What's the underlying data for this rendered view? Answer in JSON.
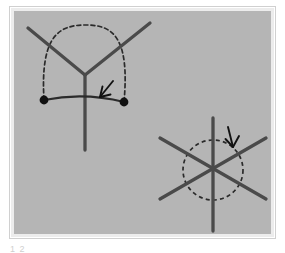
{
  "figure": {
    "canvas": {
      "width": 285,
      "height": 251,
      "background": "#ffffff"
    },
    "panel": {
      "name": "gray-panel",
      "x": 13,
      "y": 10,
      "width": 259,
      "height": 225,
      "fill": "#b5b5b5",
      "border_color": "#e8e8e8",
      "border_width": 4,
      "outer_edge_color": "#d0d0d0"
    },
    "stroke": {
      "line_color": "#4a4a4a",
      "line_width": 3.2,
      "dash_color": "#2a2a2a",
      "dash_width": 1.6,
      "dash_pattern": "4 3",
      "arrow_color": "#1a1a1a",
      "dot_color": "#111111",
      "dot_radius": 4.2
    },
    "left_diagram": {
      "name": "y-vertex-with-dashed-dome",
      "vertex": {
        "x": 85,
        "y": 75
      },
      "arms": [
        {
          "name": "upper-left-arm",
          "x1": 28,
          "y1": 28,
          "x2": 85,
          "y2": 75
        },
        {
          "name": "upper-right-arm",
          "x1": 150,
          "y1": 23,
          "x2": 85,
          "y2": 75
        },
        {
          "name": "lower-stem",
          "x1": 85,
          "y1": 75,
          "x2": 85,
          "y2": 150
        }
      ],
      "dashed_arc": {
        "name": "dashed-dome-arc",
        "path": "M 44,100 C 40,34 60,25 86,25 C 112,25 130,36 124,102"
      },
      "solid_curve": {
        "name": "solid-chord-curve",
        "path": "M 44,100 Q 84,92 124,102"
      },
      "endpoints": [
        {
          "name": "left-endpoint-dot",
          "x": 44,
          "y": 100
        },
        {
          "name": "right-endpoint-dot",
          "x": 124,
          "y": 102
        }
      ],
      "arrow": {
        "name": "left-arrow",
        "shaft": {
          "x1": 113,
          "y1": 82,
          "x2": 100,
          "y2": 97
        },
        "head": "M 100,97 L 107,88 M 100,97 L 110,96"
      }
    },
    "right_diagram": {
      "name": "six-ray-star-with-dashed-circle",
      "center": {
        "x": 213,
        "y": 170
      },
      "lines": [
        {
          "name": "vertical-line",
          "x1": 213,
          "y1": 118,
          "x2": 213,
          "y2": 231
        },
        {
          "name": "diagonal-line-up-right",
          "x1": 160,
          "y1": 199,
          "x2": 266,
          "y2": 138
        },
        {
          "name": "diagonal-line-down-right",
          "x1": 160,
          "y1": 138,
          "x2": 266,
          "y2": 199
        }
      ],
      "dashed_circle": {
        "name": "dashed-circle",
        "cx": 213,
        "cy": 170,
        "r": 30
      },
      "arrow": {
        "name": "right-arrow",
        "shaft": {
          "x1": 229,
          "y1": 128,
          "x2": 233,
          "y2": 146
        },
        "head": "M 233,146 L 227,137 M 233,146 L 238,136"
      }
    },
    "caption": {
      "name": "clipped-caption",
      "text": "1 2"
    }
  }
}
